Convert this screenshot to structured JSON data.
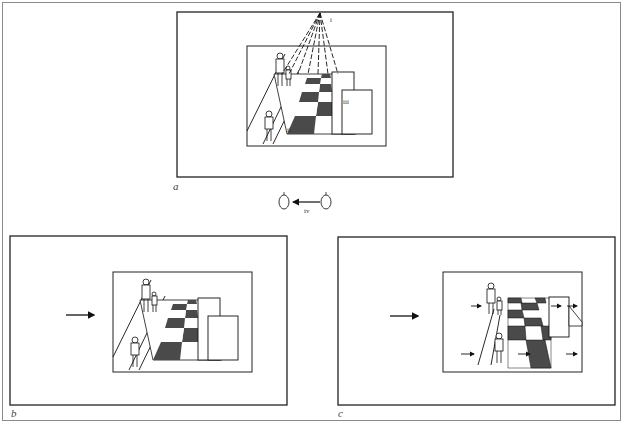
{
  "figure": {
    "panels": [
      {
        "id": "a",
        "label": "a"
      },
      {
        "id": "b",
        "label": "b"
      },
      {
        "id": "c",
        "label": "c"
      }
    ],
    "annotations": {
      "vanishing_point": "i",
      "floor_tile": "ii",
      "box": "iii",
      "eye_movement": "iv"
    },
    "colors": {
      "line": "#111111",
      "dark_tile": "#4a4a4a",
      "frame_gray": "#8a8a8a",
      "background": "#ffffff"
    }
  }
}
